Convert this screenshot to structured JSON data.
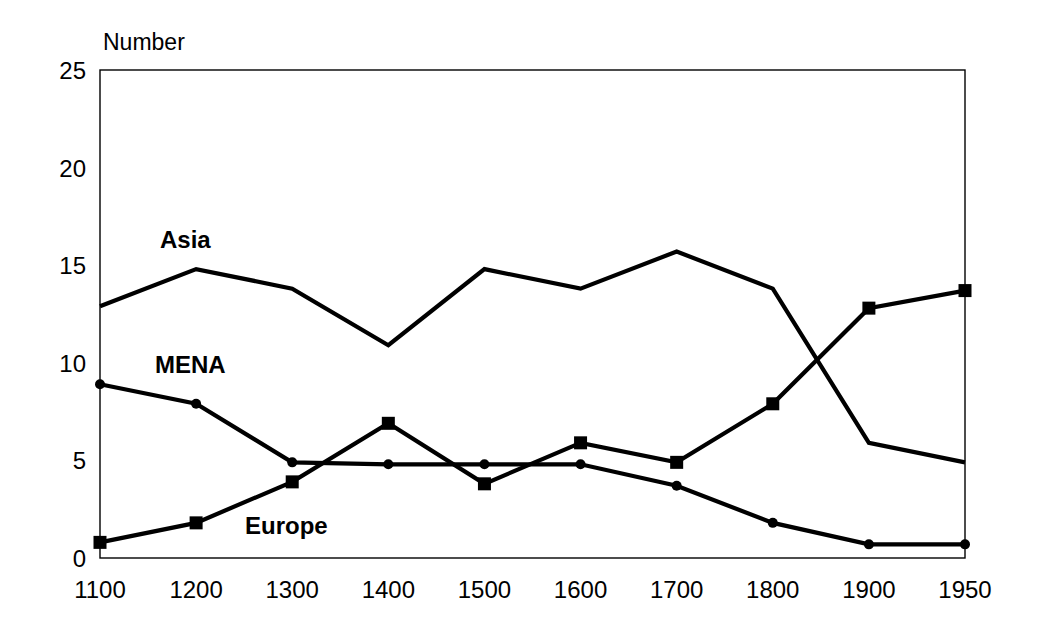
{
  "chart_data": {
    "type": "line",
    "title": "",
    "xlabel": "",
    "ylabel": "Number",
    "ylim": [
      0,
      25
    ],
    "yticks": [
      0,
      5,
      10,
      15,
      20,
      25
    ],
    "grid": false,
    "legend": "inline-labels",
    "categories": [
      "1100",
      "1200",
      "1300",
      "1400",
      "1500",
      "1600",
      "1700",
      "1800",
      "1900",
      "1950"
    ],
    "series": [
      {
        "name": "Asia",
        "marker": "none",
        "label_text": "Asia",
        "values": [
          12.9,
          14.8,
          13.8,
          10.9,
          14.8,
          13.8,
          15.7,
          13.8,
          5.9,
          4.9
        ]
      },
      {
        "name": "MENA",
        "marker": "circle",
        "label_text": "MENA",
        "values": [
          8.9,
          7.9,
          4.9,
          4.8,
          4.8,
          4.8,
          3.7,
          1.8,
          0.7,
          0.7
        ]
      },
      {
        "name": "Europe",
        "marker": "square",
        "label_text": "Europe",
        "values": [
          0.8,
          1.8,
          3.9,
          6.9,
          3.8,
          5.9,
          4.9,
          7.9,
          12.8,
          13.7
        ]
      }
    ],
    "colors": {
      "line": "#000000",
      "axis": "#000000",
      "background": "#ffffff"
    }
  },
  "axis": {
    "y_title": "Number",
    "y_tick_labels": [
      "0",
      "5",
      "10",
      "15",
      "20",
      "25"
    ],
    "x_tick_labels": [
      "1100",
      "1200",
      "1300",
      "1400",
      "1500",
      "1600",
      "1700",
      "1800",
      "1900",
      "1950"
    ]
  },
  "labels": {
    "asia": "Asia",
    "mena": "MENA",
    "europe": "Europe"
  }
}
